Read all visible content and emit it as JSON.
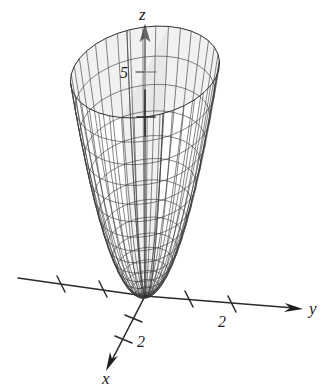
{
  "figure": {
    "kind": "3d-surface-plot",
    "background_color": "#ffffff",
    "mesh_color": "#3a3a3a",
    "mesh_back_color": "#8e8e8e",
    "surface_fill_color": "#d9d9d9",
    "axis_color": "#2b2b2b",
    "label_color": "#1a1a1a"
  },
  "axes": {
    "z": {
      "label": "z",
      "label_x": 139,
      "label_y": 20,
      "arrow_x": 145,
      "arrow_y": 26,
      "origin_x": 145,
      "origin_y": 296,
      "ticks": [
        {
          "label": "5",
          "value": 5,
          "x": 145,
          "y": 72,
          "label_x": 122,
          "label_y": 78
        },
        {
          "label": "",
          "value": 10,
          "x": 145,
          "y": 116,
          "label_x": 0,
          "label_y": 0
        }
      ]
    },
    "y": {
      "label": "y",
      "label_x": 309,
      "label_y": 312,
      "arrow_x": 296,
      "arrow_y": 300,
      "ticks": [
        {
          "label": "",
          "value": -4,
          "x": 61,
          "y": 283
        },
        {
          "label": "",
          "value": -2,
          "x": 103,
          "y": 288
        },
        {
          "label": "2",
          "value": 2,
          "x": 189,
          "y": 299,
          "label_x": 181,
          "label_y": 320
        },
        {
          "label": "2",
          "value": 4,
          "x": 232,
          "y": 304,
          "label_x": 224,
          "label_y": 325
        }
      ]
    },
    "x": {
      "label": "x",
      "label_x": 104,
      "label_y": 382,
      "arrow_x": 112,
      "arrow_y": 365,
      "ticks": [
        {
          "label": "",
          "value": 1,
          "x": 133,
          "y": 319
        },
        {
          "label": "2",
          "value": 2,
          "x": 123,
          "y": 340,
          "label_x": 139,
          "label_y": 345
        }
      ]
    }
  },
  "chart_data": {
    "type": "surface",
    "equation": "z = x^2 + y^2",
    "title": "",
    "xlabel": "x",
    "ylabel": "y",
    "zlabel": "z",
    "xlim": [
      -2.4,
      2.4
    ],
    "ylim": [
      -2.4,
      2.4
    ],
    "zlim": [
      0,
      5.8
    ],
    "z_ticks": [
      5
    ],
    "y_ticks": [
      2,
      4
    ],
    "x_ticks": [
      2
    ],
    "grid": false,
    "legend": false,
    "mesh_radial_divisions": 36,
    "mesh_circular_divisions": 16
  },
  "labels": {
    "z_axis": "z",
    "y_axis": "y",
    "x_axis": "x",
    "z_tick_5": "5",
    "y_tick_2": "2",
    "x_tick_2": "2"
  }
}
